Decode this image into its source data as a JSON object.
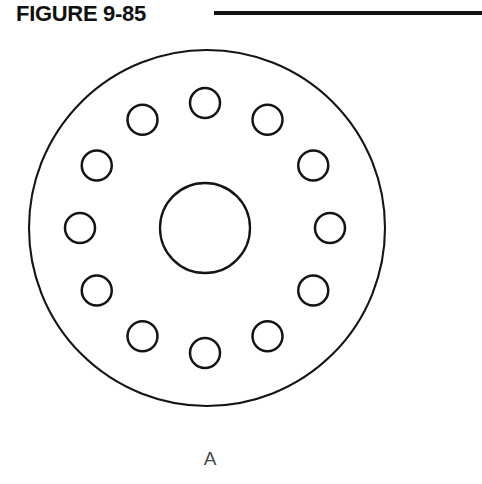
{
  "header": {
    "title": "FIGURE 9-85",
    "rule_color": "#111111"
  },
  "view": {
    "label": "A"
  },
  "drawing": {
    "type": "mechanical-part-orthographic-view",
    "description": "Circular flange / disc with central bore and twelve equally spaced bolt holes",
    "line_color": "#141414",
    "background_color": "#ffffff",
    "outer_circle": {
      "name": "outer-diameter",
      "center_x": 207,
      "center_y": 198,
      "radius": 178
    },
    "center_bore": {
      "name": "center-bore",
      "center_x": 205,
      "center_y": 198,
      "radius": 45
    },
    "bolt_pattern": {
      "name": "bolt-circle",
      "count": 12,
      "hole_radius": 15,
      "bolt_circle_radius": 125,
      "angle_step_degrees": 30,
      "start_angle_degrees": 0,
      "center_x": 205,
      "center_y": 198,
      "holes": [
        {
          "index": 1,
          "angle": 0,
          "cx": 205,
          "cy": 73
        },
        {
          "index": 2,
          "angle": 30,
          "cx": 267,
          "cy": 90
        },
        {
          "index": 3,
          "angle": 60,
          "cx": 313,
          "cy": 136
        },
        {
          "index": 4,
          "angle": 90,
          "cx": 330,
          "cy": 198
        },
        {
          "index": 5,
          "angle": 120,
          "cx": 313,
          "cy": 260
        },
        {
          "index": 6,
          "angle": 150,
          "cx": 267,
          "cy": 306
        },
        {
          "index": 7,
          "angle": 180,
          "cx": 205,
          "cy": 323
        },
        {
          "index": 8,
          "angle": 210,
          "cx": 143,
          "cy": 306
        },
        {
          "index": 9,
          "angle": 240,
          "cx": 97,
          "cy": 260
        },
        {
          "index": 10,
          "angle": 270,
          "cx": 80,
          "cy": 198
        },
        {
          "index": 11,
          "angle": 300,
          "cx": 97,
          "cy": 136
        },
        {
          "index": 12,
          "angle": 330,
          "cx": 143,
          "cy": 90
        }
      ]
    }
  }
}
